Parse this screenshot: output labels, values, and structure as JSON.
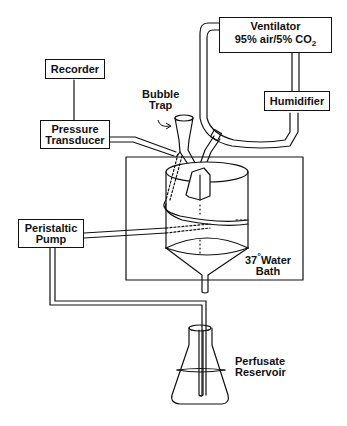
{
  "diagram": {
    "components": {
      "ventilator": {
        "line1": "Ventilator",
        "line2_prefix": "95% air/5% CO",
        "line2_sub": "2"
      },
      "humidifier": {
        "label": "Humidifier"
      },
      "recorder": {
        "label": "Recorder"
      },
      "pressure_transducer": {
        "line1": "Pressure",
        "line2": "Transducer"
      },
      "bubble_trap": {
        "line1": "Bubble",
        "line2": "Trap"
      },
      "peristaltic_pump": {
        "line1": "Peristaltic",
        "line2": "Pump"
      },
      "water_bath": {
        "line1_num": "37",
        "line1_deg": "°",
        "line1_text": "Water",
        "line2": "Bath"
      },
      "perfusate_reservoir": {
        "line1": "Perfusate",
        "line2": "Reservoir"
      }
    },
    "connections": [
      {
        "from": "Recorder",
        "to": "Pressure Transducer"
      },
      {
        "from": "Pressure Transducer",
        "to": "Bubble Trap"
      },
      {
        "from": "Ventilator",
        "to": "Humidifier"
      },
      {
        "from": "Humidifier",
        "to": "Lung (trachea)"
      },
      {
        "from": "Ventilator",
        "to": "Lung (trachea)"
      },
      {
        "from": "Peristaltic Pump",
        "to": "Bubble Trap / Lung"
      },
      {
        "from": "Perfusate Reservoir",
        "to": "Peristaltic Pump"
      },
      {
        "from": "Chamber outlet",
        "to": "Perfusate Reservoir"
      }
    ]
  }
}
